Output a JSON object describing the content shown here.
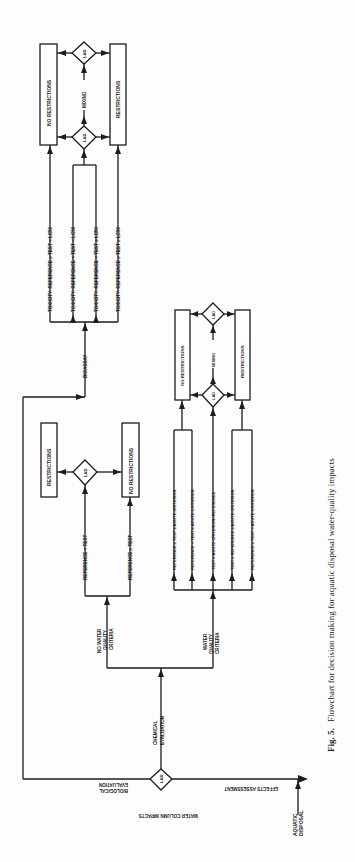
{
  "orientation": "rotated-90-ccw",
  "caption": {
    "label": "Fig. 5.",
    "text": "Flowchart for decision making for aquatic disposal water-quality impacts"
  },
  "root": {
    "aquatic_disposal": [
      "AQUATIC",
      "DISPOSAL"
    ],
    "effects_assessment": "EFFECTS ASSESSMENT",
    "water_column_impacts": "WATER COLUMN IMPACTS",
    "lad": "LAD",
    "biological_evaluation": [
      "BIOLOGICAL",
      "EVALUATION"
    ],
    "chemical_evaluation": [
      "CHEMICAL",
      "EVALUATION"
    ]
  },
  "bioassay_branch": {
    "label": "BIOASSAY",
    "conditions": [
      "TOXICITY: REFERENCE ≥ TEST < LC50",
      "TOXICITY: REFERENCE < TEST < LC50",
      "TOXICITY: REFERENCE < TEST ≥ LC50",
      "TOXICITY: REFERENCE ≥ TEST ≥ LC50"
    ],
    "lad_upper": "LAD",
    "lad_lower": "LAD",
    "mixing": "MIXING",
    "no_restrictions": "NO RESTRICTIONS",
    "restrictions": "RESTRICTIONS"
  },
  "no_wqc_branch": {
    "label": [
      "NO WATER",
      "QUALITY",
      "CRITERIA"
    ],
    "conditions": [
      "REFERENCE < TEST",
      "REFERENCE ≥ TEST"
    ],
    "lad": "LAD",
    "restrictions": "RESTRICTIONS",
    "no_restrictions": "NO RESTRICTIONS"
  },
  "wqc_branch": {
    "label": [
      "WATER",
      "QUALITY",
      "CRITERIA"
    ],
    "conditions": [
      "REFERENCE ≥ TEST ≤ ACUTE CRITERION",
      "REFERENCE < TEST ≤ ACUTE CRITERION",
      "TEST ≥ ACUTE CRITERION>REFERENCE",
      "TEST ≥ REFERENCE ≥ ACUTE CRITERION",
      "REFERENCE ≥ TEST > ACUTE CRITERION"
    ],
    "lad_upper": "LAD",
    "lad_lower": "LAD",
    "mixing": "MIXING",
    "no_restrictions": "NO RESTRICTIONS",
    "restrictions": "RESTRICTIONS"
  }
}
